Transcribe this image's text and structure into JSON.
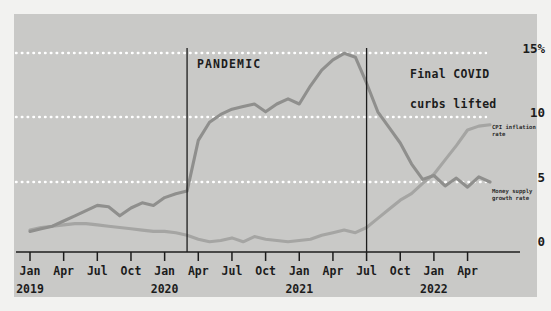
{
  "chart_data": {
    "type": "line",
    "title": "",
    "xlabel": "",
    "ylabel": "",
    "ylim": [
      -1.5,
      16.5
    ],
    "yticks": [
      0,
      5,
      10,
      15
    ],
    "ytick_labels": [
      "0",
      "5",
      "10",
      "15%"
    ],
    "grid": "horizontal dotted white at 5, 10, 15",
    "legend_position": "inline right of series end",
    "x": [
      "2019-01",
      "2019-02",
      "2019-03",
      "2019-04",
      "2019-05",
      "2019-06",
      "2019-07",
      "2019-08",
      "2019-09",
      "2019-10",
      "2019-11",
      "2019-12",
      "2020-01",
      "2020-02",
      "2020-03",
      "2020-04",
      "2020-05",
      "2020-06",
      "2020-07",
      "2020-08",
      "2020-09",
      "2020-10",
      "2020-11",
      "2020-12",
      "2021-01",
      "2021-02",
      "2021-03",
      "2021-04",
      "2021-05",
      "2021-06",
      "2021-07",
      "2021-08",
      "2021-09",
      "2021-10",
      "2021-11",
      "2021-12",
      "2022-01",
      "2022-02",
      "2022-03",
      "2022-04",
      "2022-05",
      "2022-06"
    ],
    "xtick_labels": [
      "Jan",
      "Apr",
      "Jul",
      "Oct",
      "Jan",
      "Apr",
      "Jul",
      "Oct",
      "Jan",
      "Apr",
      "Jul",
      "Oct",
      "Jan",
      "Apr"
    ],
    "xtick_years": [
      "2019",
      "",
      "",
      "",
      "2020",
      "",
      "",
      "",
      "2021",
      "",
      "",
      "",
      "2022",
      ""
    ],
    "series": [
      {
        "name": "Money supply growth rate",
        "color": "#8f8f8d",
        "values": [
          1.2,
          1.4,
          1.6,
          2.0,
          2.4,
          2.8,
          3.2,
          3.1,
          2.4,
          3.0,
          3.4,
          3.2,
          3.8,
          4.1,
          4.3,
          8.2,
          9.6,
          10.2,
          10.6,
          10.8,
          11.0,
          10.4,
          11.0,
          11.4,
          11.0,
          12.4,
          13.6,
          14.4,
          14.9,
          14.6,
          12.6,
          10.4,
          9.2,
          8.0,
          6.4,
          5.2,
          5.5,
          4.7,
          5.3,
          4.6,
          5.4,
          5.0
        ]
      },
      {
        "name": "CPI inflation rate",
        "color": "#a5a5a3",
        "values": [
          1.3,
          1.5,
          1.6,
          1.7,
          1.8,
          1.8,
          1.7,
          1.6,
          1.5,
          1.4,
          1.3,
          1.2,
          1.2,
          1.1,
          0.9,
          0.6,
          0.4,
          0.5,
          0.7,
          0.4,
          0.8,
          0.6,
          0.5,
          0.4,
          0.5,
          0.6,
          0.9,
          1.1,
          1.3,
          1.1,
          1.5,
          2.2,
          2.9,
          3.6,
          4.1,
          4.9,
          5.6,
          6.7,
          7.8,
          9.0,
          9.3,
          9.4
        ]
      }
    ],
    "annotations": [
      {
        "label": "PANDEMIC",
        "x": "2020-03",
        "type": "vertical-line-with-label"
      },
      {
        "label": "Final COVID\ncurbs lifted",
        "x": "2021-07",
        "type": "vertical-line-with-label"
      }
    ]
  },
  "annotations": {
    "pandemic": "PANDEMIC",
    "covid_line1": "Final COVID",
    "covid_line2": "curbs lifted"
  },
  "series_labels": {
    "cpi": "CPI inflation rate",
    "money_line1": "Money supply",
    "money_line2": "growth rate"
  },
  "y_axis": {
    "t15": "15%",
    "t10": "10",
    "t5": "5",
    "t0": "0"
  },
  "x_axis": {
    "ticks": [
      {
        "label": "Jan",
        "year": "2019"
      },
      {
        "label": "Apr",
        "year": ""
      },
      {
        "label": "Jul",
        "year": ""
      },
      {
        "label": "Oct",
        "year": ""
      },
      {
        "label": "Jan",
        "year": "2020"
      },
      {
        "label": "Apr",
        "year": ""
      },
      {
        "label": "Jul",
        "year": ""
      },
      {
        "label": "Oct",
        "year": ""
      },
      {
        "label": "Jan",
        "year": "2021"
      },
      {
        "label": "Apr",
        "year": ""
      },
      {
        "label": "Jul",
        "year": ""
      },
      {
        "label": "Oct",
        "year": ""
      },
      {
        "label": "Jan",
        "year": "2022"
      },
      {
        "label": "Apr",
        "year": ""
      }
    ]
  },
  "colors": {
    "panel_bg": "#c9c9c7",
    "page_bg": "#f2f2f0",
    "gridline": "#ffffff",
    "axis": "#1c1c1c",
    "money_supply": "#8f8f8d",
    "cpi": "#a5a5a3"
  }
}
